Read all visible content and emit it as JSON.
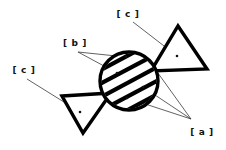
{
  "figure": {
    "background_color": "#ffffff",
    "ink_color": "#000000",
    "leader_color": "#3a3a3a",
    "width": 226,
    "height": 150,
    "labels": [
      {
        "id": "label-c-top",
        "text": "[ c ]",
        "x": 128,
        "y": 17,
        "anchor": "middle",
        "target": "top-right-triangle"
      },
      {
        "id": "label-b",
        "text": "[ b ]",
        "x": 75,
        "y": 46,
        "anchor": "middle",
        "target": "hatched-circle"
      },
      {
        "id": "label-c-left",
        "text": "[ c ]",
        "x": 24,
        "y": 73,
        "anchor": "middle",
        "target": "bottom-left-triangle"
      },
      {
        "id": "label-a",
        "text": "[ a ]",
        "x": 202,
        "y": 135,
        "anchor": "middle",
        "target": "hatched-circle"
      }
    ],
    "shapes": {
      "circle": {
        "name": "hatched-circle",
        "cx": 129,
        "cy": 81,
        "r": 29,
        "fill": "#ffffff",
        "stroke": "#000000",
        "hatch_angle_deg": -28,
        "hatch_band_count": 5
      },
      "triangle_top_right": {
        "name": "top-right-triangle",
        "points": "178,26 207,69 151,71",
        "fill": "#ffffff",
        "stroke": "#000000"
      },
      "triangle_bottom_left": {
        "name": "bottom-left-triangle",
        "points": "62,96 111,93 83,133",
        "fill": "#ffffff",
        "stroke": "#000000"
      }
    },
    "leaders": [
      {
        "id": "leader-c-top-1",
        "from_label": "label-c-top",
        "path": "M133,22 L177,56",
        "dot": {
          "x": 177,
          "y": 56
        }
      },
      {
        "id": "leader-b-1",
        "from_label": "label-b",
        "path": "M78,52 L126,57",
        "dot": {
          "x": 126,
          "y": 57
        }
      },
      {
        "id": "leader-b-2",
        "from_label": "label-b",
        "path": "M78,52 L117,73",
        "dot": {
          "x": 117,
          "y": 73
        }
      },
      {
        "id": "leader-c-left-1",
        "from_label": "label-c-left",
        "path": "M27,79 L80,112",
        "dot": {
          "x": 80,
          "y": 112
        }
      },
      {
        "id": "leader-a-1",
        "from_label": "label-a",
        "path": "M191,119 L150,62",
        "dot": {
          "x": 150,
          "y": 62
        }
      },
      {
        "id": "leader-a-2",
        "from_label": "label-a",
        "path": "M191,119 L143,87",
        "dot": {
          "x": 143,
          "y": 87
        }
      },
      {
        "id": "leader-a-3",
        "from_label": "label-a",
        "path": "M191,119 L127,98",
        "dot": {
          "x": 127,
          "y": 98
        }
      }
    ]
  }
}
